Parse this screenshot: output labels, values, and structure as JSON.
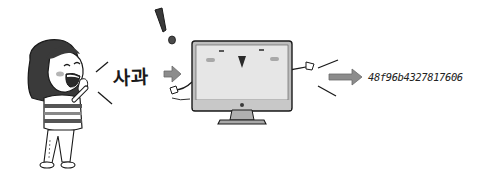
{
  "scene": {
    "description": "Girl speaks a word to a computer, which converts it into a hash string",
    "speaker": {
      "label": "girl-speaking"
    },
    "input": {
      "text": "사과"
    },
    "processor": {
      "label": "computer-monitor"
    },
    "output": {
      "text": "48f96b4327817606"
    }
  },
  "colors": {
    "outline": "#1a1a1a",
    "arrow_fill": "#8c8c8c",
    "screen_fill": "#e6e6e6",
    "bezel_fill": "#bdbdbd",
    "stand_fill": "#a8a8a8",
    "hair_fill": "#3a3a3a",
    "cheek_fill": "#b5b5b5"
  }
}
